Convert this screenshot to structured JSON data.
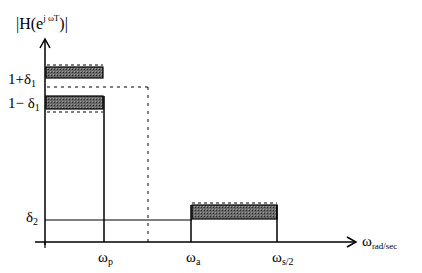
{
  "diagram": {
    "y_axis": {
      "label_prefix": "|H(e",
      "label_sup": "j ωT",
      "label_suffix": ")|"
    },
    "x_axis": {
      "label_main": "ω",
      "label_sub": "rad/sec"
    },
    "y_ticks": [
      {
        "main": "1+δ",
        "sub": "1"
      },
      {
        "main": "1− δ",
        "sub": "1"
      },
      {
        "main": "δ",
        "sub": "2"
      }
    ],
    "x_ticks": [
      {
        "main": "ω",
        "sub": "p"
      },
      {
        "main": "ω",
        "sub": "a"
      },
      {
        "main": "ω",
        "sub": "s/2"
      }
    ],
    "colors": {
      "line": "#000000",
      "hatch_fill": "#555555",
      "background": "#ffffff"
    }
  }
}
